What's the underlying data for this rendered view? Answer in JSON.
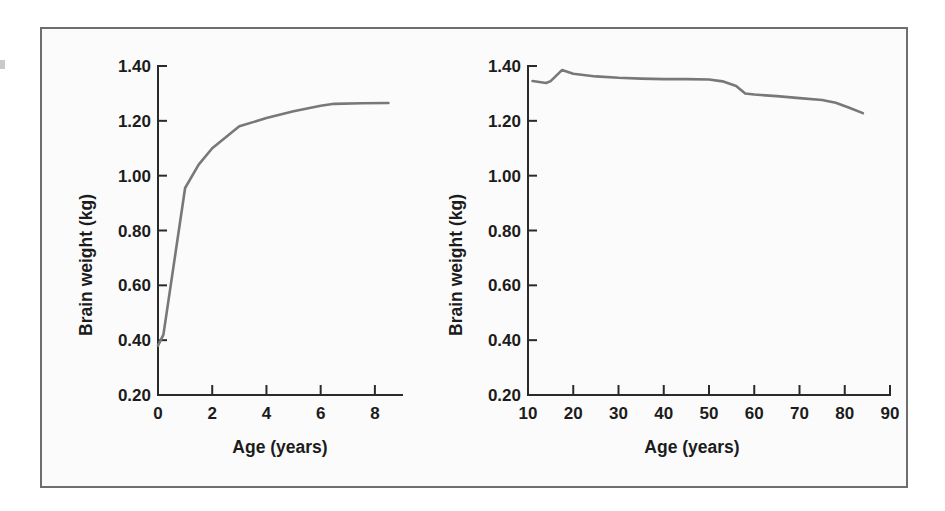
{
  "figure": {
    "panels": [
      {
        "id": "childhood",
        "xlabel": "Age (years)",
        "ylabel": "Brain weight (kg)",
        "xticks": [
          "0",
          "2",
          "4",
          "6",
          "8"
        ],
        "yticks": [
          "1.40",
          "1.20",
          "1.00",
          "0.80",
          "0.60",
          "0.40",
          "0.20"
        ]
      },
      {
        "id": "adulthood",
        "xlabel": "Age (years)",
        "ylabel": "Brain weight (kg)",
        "xticks": [
          "10",
          "20",
          "30",
          "40",
          "50",
          "60",
          "70",
          "80",
          "90"
        ],
        "yticks": [
          "1.40",
          "1.20",
          "1.00",
          "0.80",
          "0.60",
          "0.40",
          "0.20"
        ]
      }
    ],
    "line_color": "#787878",
    "axis_color": "#2a2a2a",
    "frame_color": "#6e6e6e"
  },
  "chart_data": [
    {
      "type": "line",
      "title": "",
      "xlabel": "Age (years)",
      "ylabel": "Brain weight (kg)",
      "xlim": [
        0,
        9
      ],
      "ylim": [
        0.2,
        1.4
      ],
      "xticks": [
        0,
        2,
        4,
        6,
        8
      ],
      "yticks": [
        1.4,
        1.2,
        1.0,
        0.8,
        0.6,
        0.4,
        0.2
      ],
      "grid": false,
      "legend": "none",
      "series": [
        {
          "name": "Brain weight (childhood)",
          "x": [
            0,
            0.2,
            1.0,
            1.5,
            2.0,
            3.0,
            4.0,
            5.0,
            6.0,
            6.5,
            7.5,
            8.5
          ],
          "y": [
            0.38,
            0.42,
            0.955,
            1.04,
            1.1,
            1.18,
            1.21,
            1.235,
            1.255,
            1.262,
            1.264,
            1.265
          ]
        }
      ]
    },
    {
      "type": "line",
      "title": "",
      "xlabel": "Age (years)",
      "ylabel": "Brain weight (kg)",
      "xlim": [
        10,
        90
      ],
      "ylim": [
        0.2,
        1.4
      ],
      "xticks": [
        10,
        20,
        30,
        40,
        50,
        60,
        70,
        80,
        90
      ],
      "yticks": [
        1.4,
        1.2,
        1.0,
        0.8,
        0.6,
        0.4,
        0.2
      ],
      "grid": false,
      "legend": "none",
      "series": [
        {
          "name": "Brain weight (adulthood)",
          "x": [
            11,
            14,
            15,
            17.5,
            20,
            25,
            30,
            35,
            40,
            45,
            50,
            53,
            56,
            58,
            60,
            65,
            70,
            75,
            78,
            81,
            84
          ],
          "y": [
            1.345,
            1.338,
            1.345,
            1.385,
            1.372,
            1.362,
            1.357,
            1.354,
            1.352,
            1.352,
            1.351,
            1.344,
            1.327,
            1.3,
            1.296,
            1.29,
            1.283,
            1.276,
            1.266,
            1.248,
            1.228
          ]
        }
      ]
    }
  ]
}
